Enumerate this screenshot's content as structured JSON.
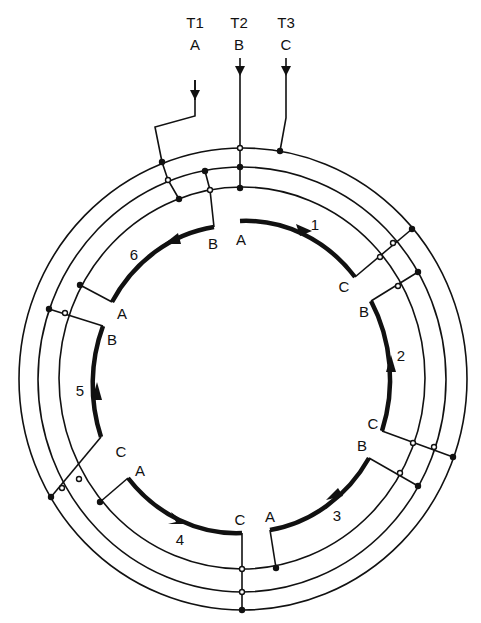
{
  "terminals": [
    {
      "id": "T1",
      "phase": "A"
    },
    {
      "id": "T2",
      "phase": "B"
    },
    {
      "id": "T3",
      "phase": "C"
    }
  ],
  "coils": [
    {
      "number": "1",
      "start": "A",
      "end": "C"
    },
    {
      "number": "2",
      "start": "B",
      "end": "C"
    },
    {
      "number": "3",
      "start": "B",
      "end": "A"
    },
    {
      "number": "4",
      "start": "A",
      "end": "C"
    },
    {
      "number": "5",
      "start": "C",
      "end": "B"
    },
    {
      "number": "6",
      "start": "A",
      "end": "B"
    }
  ],
  "colors": {
    "ink": "#111111",
    "background": "#ffffff"
  }
}
